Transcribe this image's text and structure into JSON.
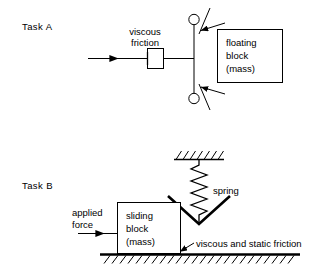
{
  "figure": {
    "background_color": "#ffffff",
    "line_color": "#000000",
    "width": 318,
    "height": 273
  },
  "task_a": {
    "label": "Task A",
    "damper_label_line1": "viscous",
    "damper_label_line2": "friction",
    "block_label_line1": "floating",
    "block_label_line2": "block",
    "block_label_line3": "(mass)",
    "force_arrow_name": "input-force-arrow",
    "roller_count": 2,
    "elements": [
      "input-force-arrow",
      "viscous-friction-dashpot",
      "connecting-rod",
      "upper-roller-support",
      "lower-roller-support",
      "floating-block-box"
    ]
  },
  "task_b": {
    "label": "Task B",
    "spring_label": "spring",
    "applied_force_line1": "applied",
    "applied_force_line2": "force",
    "block_label_line1": "sliding",
    "block_label_line2": "block",
    "block_label_line3": "(mass)",
    "friction_label": "viscous and static friction",
    "spring_coil_count": 8,
    "elements": [
      "ceiling-hatching",
      "spring-coil",
      "spring-chevron-bracket",
      "sliding-block-box",
      "applied-force-arrow",
      "ground-line",
      "ground-hatching",
      "friction-pointer-arrow"
    ]
  }
}
